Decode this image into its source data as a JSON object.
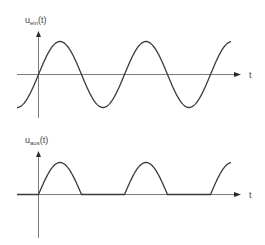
{
  "diagram": {
    "type": "half-wave rectifier waveforms",
    "plots": [
      {
        "id": "input",
        "ylabel_main": "u",
        "ylabel_sub": "ein",
        "ylabel_arg": "(t)",
        "xlabel": "t",
        "signal": "sine",
        "description": "input voltage u_ein(t), full sine wave"
      },
      {
        "id": "output",
        "ylabel_main": "u",
        "ylabel_sub": "aus",
        "ylabel_arg": "(t)",
        "xlabel": "t",
        "signal": "half-wave rectified sine",
        "description": "output voltage u_aus(t), only positive half-waves"
      }
    ],
    "colors": {
      "axis": "#7a7a7a",
      "wave": "#3a3a3a",
      "text": "#444444"
    }
  }
}
